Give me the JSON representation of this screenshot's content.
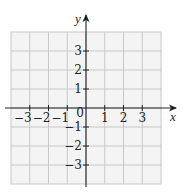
{
  "chart_data": {
    "type": "scatter",
    "title": "",
    "xlabel": "x",
    "ylabel": "y",
    "xlim": [
      -4,
      4
    ],
    "ylim": [
      -4,
      4
    ],
    "grid": true,
    "x_ticks": [
      -3,
      -2,
      -1,
      0,
      1,
      2,
      3
    ],
    "y_ticks": [
      3,
      2,
      1,
      -1,
      -2,
      -3
    ],
    "x_tick_labels": [
      "−3",
      "−2",
      "−1",
      "0",
      "1",
      "2",
      "3"
    ],
    "y_tick_labels": [
      "3",
      "2",
      "1",
      "−1",
      "−2",
      "−3"
    ],
    "series": [],
    "legend": null
  },
  "axes": {
    "x_label": "x",
    "y_label": "y",
    "origin_label": "0"
  },
  "colors": {
    "grid_line": "#c8c8c8",
    "grid_bg": "#f4f4f4",
    "axis": "#222222"
  }
}
